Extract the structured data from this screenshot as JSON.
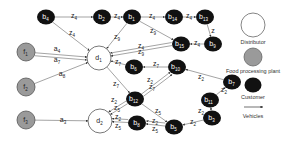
{
  "diagram": {
    "type": "supply-chain network",
    "nodes": [
      {
        "id": "b4",
        "base": "b",
        "sub": "4",
        "kind": "customer",
        "x": 46,
        "y": 17
      },
      {
        "id": "b2",
        "base": "b",
        "sub": "2",
        "kind": "customer",
        "x": 102,
        "y": 17
      },
      {
        "id": "b1",
        "base": "b",
        "sub": "1",
        "kind": "customer",
        "x": 132,
        "y": 17
      },
      {
        "id": "b14",
        "base": "b",
        "sub": "14",
        "kind": "customer",
        "x": 174,
        "y": 17
      },
      {
        "id": "b13",
        "base": "b",
        "sub": "13",
        "kind": "customer",
        "x": 205,
        "y": 17
      },
      {
        "id": "b15",
        "base": "b",
        "sub": "15",
        "kind": "customer",
        "x": 181,
        "y": 44
      },
      {
        "id": "b9",
        "base": "b",
        "sub": "9",
        "kind": "customer",
        "x": 213,
        "y": 44
      },
      {
        "id": "d1",
        "base": "d",
        "sub": "1",
        "kind": "distributor",
        "x": 99,
        "y": 58
      },
      {
        "id": "f1",
        "base": "f",
        "sub": "1",
        "kind": "plant",
        "x": 26,
        "y": 52
      },
      {
        "id": "f2",
        "base": "f",
        "sub": "2",
        "kind": "plant",
        "x": 26,
        "y": 87
      },
      {
        "id": "f3",
        "base": "f",
        "sub": "3",
        "kind": "plant",
        "x": 26,
        "y": 120
      },
      {
        "id": "b6",
        "base": "b",
        "sub": "6",
        "kind": "customer",
        "x": 134,
        "y": 67
      },
      {
        "id": "b10",
        "base": "b",
        "sub": "10",
        "kind": "customer",
        "x": 177,
        "y": 67
      },
      {
        "id": "b7",
        "base": "b",
        "sub": "7",
        "kind": "customer",
        "x": 232,
        "y": 82
      },
      {
        "id": "b12",
        "base": "b",
        "sub": "12",
        "kind": "customer",
        "x": 135,
        "y": 99
      },
      {
        "id": "b11",
        "base": "b",
        "sub": "11",
        "kind": "customer",
        "x": 210,
        "y": 100
      },
      {
        "id": "b3",
        "base": "b",
        "sub": "3",
        "kind": "customer",
        "x": 212,
        "y": 118
      },
      {
        "id": "d2",
        "base": "d",
        "sub": "2",
        "kind": "distributor",
        "x": 100,
        "y": 121
      },
      {
        "id": "b8",
        "base": "b",
        "sub": "8",
        "kind": "customer",
        "x": 137,
        "y": 123
      },
      {
        "id": "b5",
        "base": "b",
        "sub": "5",
        "kind": "customer",
        "x": 174,
        "y": 127
      }
    ],
    "edges": [
      {
        "from": "f1",
        "to": "d1",
        "label": "a",
        "sub": "4",
        "lx": 57,
        "ly": 49
      },
      {
        "from": "f1",
        "to": "d1",
        "label": "a",
        "sub": "7",
        "lx": 57,
        "ly": 60,
        "offset": true
      },
      {
        "from": "f2",
        "to": "d1",
        "label": "a",
        "sub": "8",
        "lx": 62,
        "ly": 74
      },
      {
        "from": "f3",
        "to": "d2",
        "label": "a",
        "sub": "3",
        "lx": 63,
        "ly": 120
      },
      {
        "from": "b4",
        "to": "b2",
        "label": "z",
        "sub": "4",
        "lx": 74,
        "ly": 16
      },
      {
        "from": "b2",
        "to": "b1",
        "label": "z",
        "sub": "4",
        "lx": 117,
        "ly": 16
      },
      {
        "from": "b1",
        "to": "b14",
        "label": "z",
        "sub": "4",
        "lx": 152,
        "ly": 16
      },
      {
        "from": "b14",
        "to": "b13",
        "label": "z",
        "sub": "4",
        "lx": 189,
        "ly": 16
      },
      {
        "from": "b13",
        "to": "b9",
        "label": "z",
        "sub": "",
        "lx": 213,
        "ly": 31
      },
      {
        "from": "b9",
        "to": "b15",
        "label": "z",
        "sub": "4",
        "lx": 197,
        "ly": 43
      },
      {
        "from": "b1",
        "to": "b15",
        "label": "z",
        "sub": "9",
        "lx": 153,
        "ly": 31
      },
      {
        "from": "b15",
        "to": "d1",
        "label": "z",
        "sub": "4",
        "lx": 141,
        "ly": 46
      },
      {
        "from": "b15",
        "to": "d1",
        "label": "z",
        "sub": "9",
        "lx": 141,
        "ly": 52,
        "offset": true
      },
      {
        "from": "b4",
        "to": "d1",
        "label": "z",
        "sub": "4",
        "lx": 72,
        "ly": 33
      },
      {
        "from": "b1",
        "to": "d1",
        "label": "z",
        "sub": "9",
        "lx": 117,
        "ly": 37
      },
      {
        "from": "b6",
        "to": "d1",
        "label": "z",
        "sub": "7",
        "lx": 118,
        "ly": 62
      },
      {
        "from": "b10",
        "to": "b6",
        "label": "z",
        "sub": "7",
        "lx": 156,
        "ly": 64
      },
      {
        "from": "b12",
        "to": "b10",
        "label": "z",
        "sub": "7",
        "lx": 152,
        "ly": 87
      },
      {
        "from": "b12",
        "to": "b10",
        "label": "z",
        "sub": "2",
        "lx": 150,
        "ly": 80,
        "offset": true
      },
      {
        "from": "b7",
        "to": "b10",
        "label": "z",
        "sub": "2",
        "lx": 201,
        "ly": 77
      },
      {
        "from": "d1",
        "to": "b12",
        "label": "z",
        "sub": "7",
        "lx": 116,
        "ly": 84
      },
      {
        "from": "b12",
        "to": "d2",
        "label": "z",
        "sub": "2",
        "lx": 114,
        "ly": 100
      },
      {
        "from": "b12",
        "to": "d2",
        "label": "z",
        "sub": "5",
        "lx": 117,
        "ly": 108,
        "offset": true
      },
      {
        "from": "b11",
        "to": "b7",
        "label": "z",
        "sub": "2",
        "lx": 224,
        "ly": 90
      },
      {
        "from": "b3",
        "to": "b11",
        "label": "z",
        "sub": "2",
        "lx": 201,
        "ly": 111
      },
      {
        "from": "b12",
        "to": "b5",
        "label": "z",
        "sub": "5",
        "lx": 158,
        "ly": 111
      },
      {
        "from": "b3",
        "to": "b5",
        "label": "z",
        "sub": "2",
        "lx": 193,
        "ly": 122
      },
      {
        "from": "b5",
        "to": "b8",
        "label": "z",
        "sub": "2",
        "lx": 155,
        "ly": 121
      },
      {
        "from": "b5",
        "to": "b8",
        "label": "z",
        "sub": "5",
        "lx": 155,
        "ly": 129,
        "offset": true
      },
      {
        "from": "b8",
        "to": "d2",
        "label": "z",
        "sub": "2",
        "lx": 118,
        "ly": 117
      },
      {
        "from": "b8",
        "to": "d2",
        "label": "z",
        "sub": "5",
        "lx": 118,
        "ly": 126,
        "offset": true
      }
    ]
  },
  "legend": {
    "items": [
      {
        "kind": "distributor",
        "label": "Distributor"
      },
      {
        "kind": "plant",
        "label": "Food processing plant"
      },
      {
        "kind": "customer",
        "label": "Customer"
      },
      {
        "kind": "vehicle",
        "label": "Vehicles"
      }
    ]
  },
  "colors": {
    "customer_fill": "#111111",
    "plant_fill": "#9a9a9a",
    "distributor_fill": "#ffffff",
    "stroke": "#555555",
    "edge": "#666666"
  }
}
